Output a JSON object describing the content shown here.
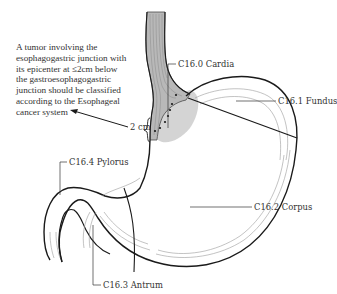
{
  "diagram": {
    "type": "anatomical-diagram",
    "annotation": {
      "lines": [
        "A tumor involving the",
        "esophagogastric junction with",
        "its epicenter at ≤2cm below",
        "the gastroesophagogastric",
        "junction should be classified",
        "according to the Esophageal",
        "cancer system"
      ]
    },
    "measurement_label": "2 cm",
    "regions": [
      {
        "code": "C16.0",
        "name": "Cardia",
        "label": "C16.0 Cardia"
      },
      {
        "code": "C16.1",
        "name": "Fundus",
        "label": "C16.1 Fundus"
      },
      {
        "code": "C16.2",
        "name": "Corpus",
        "label": "C16.2 Corpus"
      },
      {
        "code": "C16.3",
        "name": "Antrum",
        "label": "C16.3 Antrum"
      },
      {
        "code": "C16.4",
        "name": "Pylorus",
        "label": "C16.4 Pylorus"
      }
    ],
    "colors": {
      "outline": "#1a1a1a",
      "inner_lines": "#9a9a9a",
      "esophagus_fill": "#b5b5b5",
      "cardia_shade": "#c8c8c8",
      "text": "#333333"
    }
  }
}
